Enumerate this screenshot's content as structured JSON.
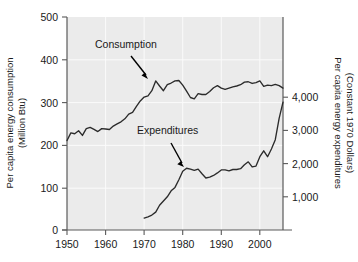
{
  "chart_data": {
    "type": "line",
    "title": "",
    "subtitle": "",
    "xlabel": "",
    "ylabel": "Per capita energy consumption (Million Btu)",
    "y2label": "Per capita energy expenditures (Constant 1970 Dollars)",
    "grid": true,
    "legend_position": "inline-annotations",
    "xlim": [
      1950,
      2006
    ],
    "ylim": [
      0,
      500
    ],
    "y2lim": [
      0,
      6410
    ],
    "xticks": [
      1950,
      1960,
      1970,
      1980,
      1990,
      2000
    ],
    "xticklabels": [
      "1950",
      "1960",
      "1970",
      "1980",
      "1990",
      "2000"
    ],
    "yticks": [
      0,
      100,
      200,
      300,
      400,
      500
    ],
    "yticklabels": [
      "0",
      "100",
      "200",
      "300",
      "400",
      "500"
    ],
    "y2ticks": [
      1000,
      2000,
      3000,
      4000
    ],
    "y2ticklabels": [
      "1,000",
      "2,000",
      "3,000",
      "4,000"
    ],
    "annotations": [
      {
        "text": "Consumption",
        "x": 1959.5,
        "y": 432
      },
      {
        "text": "Expenditures",
        "x": 1971.5,
        "y": 240
      }
    ],
    "series": [
      {
        "name": "Consumption",
        "axis": "left",
        "units": "Million Btu",
        "x": [
          1950,
          1951,
          1952,
          1953,
          1954,
          1955,
          1956,
          1957,
          1958,
          1959,
          1960,
          1961,
          1962,
          1963,
          1964,
          1965,
          1966,
          1967,
          1968,
          1969,
          1970,
          1971,
          1972,
          1973,
          1974,
          1975,
          1976,
          1977,
          1978,
          1979,
          1980,
          1981,
          1982,
          1983,
          1984,
          1985,
          1986,
          1987,
          1988,
          1989,
          1990,
          1991,
          1992,
          1993,
          1994,
          1995,
          1996,
          1997,
          1998,
          1999,
          2000,
          2001,
          2002,
          2003,
          2004,
          2005,
          2006
        ],
        "values": [
          210,
          228,
          226,
          233,
          222,
          238,
          241,
          236,
          231,
          238,
          237,
          236,
          244,
          249,
          254,
          261,
          272,
          276,
          290,
          303,
          312,
          315,
          327,
          350,
          338,
          327,
          341,
          345,
          350,
          351,
          340,
          326,
          311,
          308,
          320,
          318,
          318,
          325,
          334,
          339,
          333,
          330,
          333,
          336,
          338,
          341,
          347,
          348,
          344,
          346,
          350,
          337,
          340,
          339,
          342,
          339,
          333
        ]
      },
      {
        "name": "Expenditures",
        "axis": "left-scaled-to-right",
        "units": "Constant 1970 Dollars",
        "x": [
          1970,
          1971,
          1972,
          1973,
          1974,
          1975,
          1976,
          1977,
          1978,
          1979,
          1980,
          1981,
          1982,
          1983,
          1984,
          1985,
          1986,
          1987,
          1988,
          1989,
          1990,
          1991,
          1992,
          1993,
          1994,
          1995,
          1996,
          1997,
          1998,
          1999,
          2000,
          2001,
          2002,
          2003,
          2004,
          2005,
          2006
        ],
        "values": [
          28,
          31,
          35,
          42,
          58,
          68,
          78,
          92,
          100,
          118,
          138,
          145,
          143,
          140,
          143,
          132,
          122,
          124,
          128,
          134,
          141,
          141,
          139,
          142,
          142,
          144,
          153,
          160,
          148,
          150,
          172,
          186,
          172,
          190,
          212,
          262,
          300
        ],
        "values_right_axis": [
          360,
          400,
          450,
          540,
          740,
          870,
          1000,
          1180,
          1280,
          1510,
          1770,
          1860,
          1830,
          1795,
          1835,
          1690,
          1565,
          1590,
          1640,
          1720,
          1810,
          1810,
          1780,
          1820,
          1820,
          1845,
          1960,
          2050,
          1900,
          1925,
          2205,
          2385,
          2205,
          2435,
          2720,
          3360,
          3845
        ]
      }
    ]
  },
  "axes": {
    "left_title_line1": "Per capita energy consumption",
    "left_title_line2": "(Million Btu)",
    "right_title_line1": "Per capita energy expenditures",
    "right_title_line2": "(Constant 1970 Dollars)"
  },
  "colors": {
    "plot_background": "#ebebeb",
    "gridline": "#fbfbfb",
    "axis": "#5a5a5a",
    "line": "#2b2b2b",
    "text": "#1a1a1a",
    "page_background": "#ffffff"
  }
}
